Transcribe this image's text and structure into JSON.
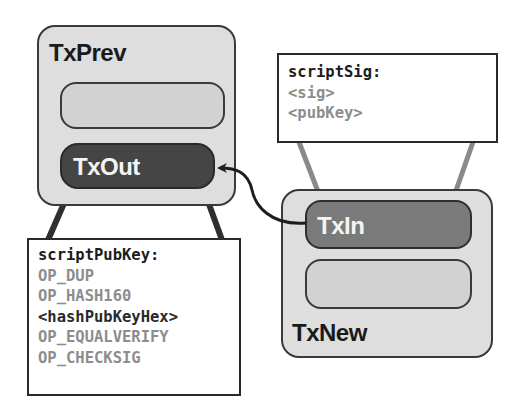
{
  "diagram": {
    "colors": {
      "tx_box_fill": "#dedede",
      "slot_fill": "#d2d2d2",
      "txout_fill": "#454545",
      "txin_fill": "#7a7a7a",
      "outline": "#2a2a2a",
      "op_text": "#8d8d8d",
      "link_dark": "#2a2a2a",
      "link_light": "#8a8a8a"
    },
    "tx_prev": {
      "title": "TxPrev",
      "output_label": "TxOut"
    },
    "tx_new": {
      "title": "TxNew",
      "input_label": "TxIn"
    },
    "script_pub_key": {
      "header": "scriptPubKey",
      "colon": ":",
      "lines": [
        {
          "text": "OP_DUP",
          "kind": "op"
        },
        {
          "text": "OP_HASH160",
          "kind": "op"
        },
        {
          "text": "<hashPubKeyHex>",
          "kind": "value"
        },
        {
          "text": "OP_EQUALVERIFY",
          "kind": "op"
        },
        {
          "text": "OP_CHECKSIG",
          "kind": "op"
        }
      ]
    },
    "script_sig": {
      "header": "scriptSig",
      "colon": ":",
      "lines": [
        {
          "text": "<sig>",
          "kind": "op"
        },
        {
          "text": "<pubKey>",
          "kind": "op"
        }
      ]
    },
    "edges": [
      {
        "from": "TxIn",
        "to": "TxOut",
        "style": "arrow"
      },
      {
        "from": "TxOut",
        "to": "scriptPubKey",
        "style": "callout"
      },
      {
        "from": "TxIn",
        "to": "scriptSig",
        "style": "callout"
      }
    ]
  }
}
